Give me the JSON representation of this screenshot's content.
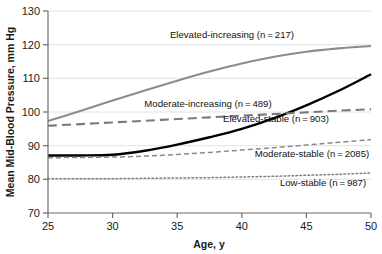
{
  "chart_data": {
    "type": "line",
    "title": "",
    "xlabel": "Age, y",
    "ylabel": "Mean Mid-Blood Pressure, mm Hg",
    "xlim": [
      25,
      50
    ],
    "ylim": [
      70,
      130
    ],
    "xticks": [
      "25",
      "30",
      "35",
      "40",
      "45",
      "50"
    ],
    "yticks": [
      "70",
      "80",
      "90",
      "100",
      "110",
      "120",
      "130"
    ],
    "grid": "horizontal",
    "legend_position": "inline-annotations",
    "x": [
      25,
      27.5,
      30,
      32.5,
      35,
      37.5,
      40,
      42.5,
      45,
      47.5,
      50
    ],
    "series": [
      {
        "name": "Elevated-increasing",
        "n": 217,
        "label": "Elevated-increasing (n = 217)",
        "color": "#8c8c8c",
        "style": "solid",
        "width": 2.1,
        "values": [
          97.3,
          100.3,
          103.4,
          106.4,
          109.3,
          112.0,
          114.4,
          116.4,
          117.9,
          118.9,
          119.6
        ]
      },
      {
        "name": "Moderate-increasing",
        "n": 489,
        "label": "Moderate-increasing (n = 489)",
        "color": "#000000",
        "style": "solid",
        "width": 2.4,
        "values": [
          87.1,
          87.1,
          87.3,
          88.5,
          90.3,
          92.5,
          95.0,
          98.2,
          102.0,
          106.3,
          111.2
        ]
      },
      {
        "name": "Elevated-stable",
        "n": 903,
        "label": "Elevated-stable (n = 903)",
        "color": "#7a7a7a",
        "style": "dashed",
        "width": 2.1,
        "values": [
          95.9,
          96.4,
          96.9,
          97.4,
          97.9,
          98.4,
          98.9,
          99.4,
          99.9,
          100.4,
          100.8
        ]
      },
      {
        "name": "Moderate-stable",
        "n": 2085,
        "label": "Moderate-stable (n = 2085)",
        "color": "#8a8a8a",
        "style": "dash-small",
        "width": 1.5,
        "values": [
          86.4,
          86.5,
          86.6,
          86.9,
          87.4,
          88.0,
          88.7,
          89.4,
          90.2,
          91.0,
          91.8
        ]
      },
      {
        "name": "Low-stable",
        "n": 987,
        "label": "Low-stable (n = 987)",
        "color": "#7f7f7f",
        "style": "dotted",
        "width": 1.5,
        "values": [
          80.2,
          80.2,
          80.2,
          80.3,
          80.4,
          80.5,
          80.7,
          80.9,
          81.2,
          81.5,
          81.9
        ]
      }
    ],
    "annotations": [
      {
        "key": "elevated_increasing",
        "text": "Elevated-increasing (n = 217)",
        "x_px": 232,
        "y_px": 38
      },
      {
        "key": "moderate_increasing",
        "text": "Moderate-increasing (n = 489)",
        "x_px": 208,
        "y_px": 107
      },
      {
        "key": "elevated_stable",
        "text": "Elevated-stable (n = 903)",
        "x_px": 276,
        "y_px": 122
      },
      {
        "key": "moderate_stable",
        "text": "Moderate-stable (n = 2085)",
        "x_px": 312,
        "y_px": 157
      },
      {
        "key": "low_stable",
        "text": "Low-stable (n = 987)",
        "x_px": 323,
        "y_px": 186
      }
    ]
  }
}
